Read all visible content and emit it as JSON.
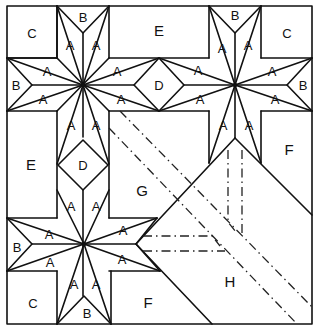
{
  "diagram": {
    "type": "quilt-block-pattern",
    "stroke_color": "#111111",
    "background": "#ffffff",
    "pieces": {
      "A": "A",
      "B": "B",
      "C": "C",
      "D": "D",
      "E": "E",
      "F": "F",
      "G": "G",
      "H": "H"
    },
    "labels": [
      {
        "id": "c-tl",
        "text": "C",
        "x": 32,
        "y": 33
      },
      {
        "id": "b-top-1",
        "text": "B",
        "x": 83,
        "y": 17
      },
      {
        "id": "a-1",
        "text": "A",
        "x": 70,
        "y": 45
      },
      {
        "id": "a-2",
        "text": "A",
        "x": 96,
        "y": 45
      },
      {
        "id": "e-top",
        "text": "E",
        "x": 159,
        "y": 30
      },
      {
        "id": "b-top-2",
        "text": "B",
        "x": 235,
        "y": 15
      },
      {
        "id": "a-3",
        "text": "A",
        "x": 222,
        "y": 48
      },
      {
        "id": "a-4",
        "text": "A",
        "x": 248,
        "y": 45
      },
      {
        "id": "c-tr",
        "text": "C",
        "x": 287,
        "y": 33
      },
      {
        "id": "b-left-1",
        "text": "B",
        "x": 16,
        "y": 85
      },
      {
        "id": "a-5",
        "text": "A",
        "x": 47,
        "y": 71
      },
      {
        "id": "a-6",
        "text": "A",
        "x": 43,
        "y": 99
      },
      {
        "id": "a-7",
        "text": "A",
        "x": 117,
        "y": 71
      },
      {
        "id": "a-8",
        "text": "A",
        "x": 121,
        "y": 99
      },
      {
        "id": "d-mid",
        "text": "D",
        "x": 159,
        "y": 85
      },
      {
        "id": "a-9",
        "text": "A",
        "x": 198,
        "y": 70
      },
      {
        "id": "a-10",
        "text": "A",
        "x": 200,
        "y": 99
      },
      {
        "id": "a-11",
        "text": "A",
        "x": 272,
        "y": 71
      },
      {
        "id": "a-12",
        "text": "A",
        "x": 275,
        "y": 99
      },
      {
        "id": "b-right-1",
        "text": "B",
        "x": 303,
        "y": 85
      },
      {
        "id": "a-13",
        "text": "A",
        "x": 71,
        "y": 125
      },
      {
        "id": "a-14",
        "text": "A",
        "x": 96,
        "y": 125
      },
      {
        "id": "a-15",
        "text": "A",
        "x": 223,
        "y": 125
      },
      {
        "id": "a-16",
        "text": "A",
        "x": 249,
        "y": 125
      },
      {
        "id": "e-left",
        "text": "E",
        "x": 31,
        "y": 164
      },
      {
        "id": "d-left",
        "text": "D",
        "x": 83,
        "y": 165
      },
      {
        "id": "f-right",
        "text": "F",
        "x": 289,
        "y": 149
      },
      {
        "id": "g-center",
        "text": "G",
        "x": 142,
        "y": 190
      },
      {
        "id": "a-17",
        "text": "A",
        "x": 71,
        "y": 206
      },
      {
        "id": "a-18",
        "text": "A",
        "x": 96,
        "y": 206
      },
      {
        "id": "a-19",
        "text": "A",
        "x": 49,
        "y": 234
      },
      {
        "id": "a-20",
        "text": "A",
        "x": 123,
        "y": 230
      },
      {
        "id": "b-left-2",
        "text": "B",
        "x": 17,
        "y": 247
      },
      {
        "id": "a-21",
        "text": "A",
        "x": 50,
        "y": 262
      },
      {
        "id": "a-22",
        "text": "A",
        "x": 122,
        "y": 259
      },
      {
        "id": "a-23",
        "text": "A",
        "x": 74,
        "y": 284
      },
      {
        "id": "a-24",
        "text": "A",
        "x": 96,
        "y": 284
      },
      {
        "id": "c-bl",
        "text": "C",
        "x": 33,
        "y": 303
      },
      {
        "id": "b-bottom",
        "text": "B",
        "x": 87,
        "y": 313
      },
      {
        "id": "f-bottom",
        "text": "F",
        "x": 148,
        "y": 302
      },
      {
        "id": "h-right",
        "text": "H",
        "x": 230,
        "y": 281
      }
    ]
  }
}
